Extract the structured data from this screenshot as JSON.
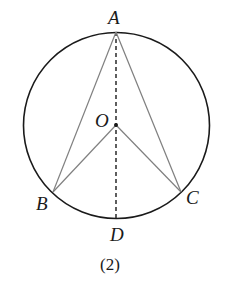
{
  "diagram": {
    "caption": "(2)",
    "colors": {
      "circle": "#1a1a1a",
      "chords": "#808080",
      "dashed": "#1a1a1a",
      "text": "#1a1a1a"
    },
    "circle": {
      "center": "O",
      "cx": 116.5,
      "cy": 125.5,
      "r": 93
    },
    "points": {
      "A": {
        "label": "A",
        "x": 116,
        "y": 32
      },
      "O": {
        "label": "O",
        "x": 116,
        "y": 125
      },
      "B": {
        "label": "B",
        "x": 53,
        "y": 192
      },
      "C": {
        "label": "C",
        "x": 181,
        "y": 192
      },
      "D": {
        "label": "D",
        "x": 116,
        "y": 219
      }
    },
    "segments": [
      {
        "from": "A",
        "to": "B",
        "style": "solid"
      },
      {
        "from": "A",
        "to": "C",
        "style": "solid"
      },
      {
        "from": "O",
        "to": "B",
        "style": "solid"
      },
      {
        "from": "O",
        "to": "C",
        "style": "solid"
      },
      {
        "from": "A",
        "to": "D",
        "style": "dashed"
      }
    ]
  }
}
